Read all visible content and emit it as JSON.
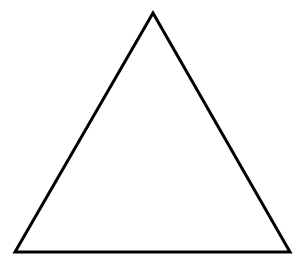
{
  "canvas": {
    "width": 302,
    "height": 270,
    "background_color": "#ffffff",
    "top_artifact_text": ""
  },
  "figure": {
    "name": "triangle",
    "shape_label": "triangle",
    "stroke_color": "#000000",
    "fill_color": "none",
    "stroke_width": 3,
    "vertices": [
      {
        "label": "apex",
        "x": 153,
        "y": 13
      },
      {
        "label": "bottom-right",
        "x": 290,
        "y": 252
      },
      {
        "label": "bottom-left",
        "x": 15,
        "y": 252
      }
    ],
    "points_attr": "153,13 290,252 15,252"
  },
  "chart_data": {
    "type": "scatter",
    "title": "",
    "xlabel": "",
    "ylabel": "",
    "x": [
      153,
      290,
      15,
      153
    ],
    "y": [
      13,
      252,
      252,
      13
    ],
    "series": [
      {
        "name": "triangle-outline",
        "values": [
          13,
          252,
          252,
          13
        ]
      }
    ],
    "xlim": [
      0,
      302
    ],
    "ylim": [
      0,
      270
    ],
    "grid": false,
    "legend": "none",
    "annotations": []
  }
}
